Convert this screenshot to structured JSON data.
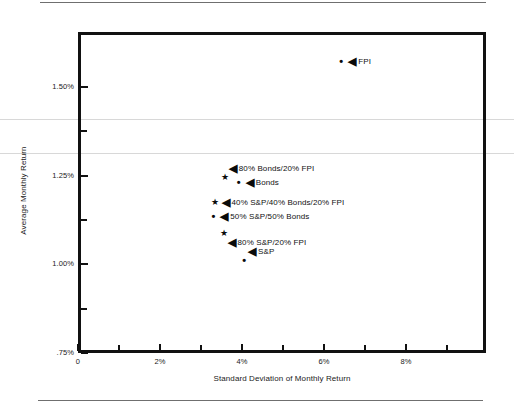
{
  "chart_data": {
    "type": "scatter",
    "title": "",
    "xlabel": "Standard Deviation of Monthly Return",
    "ylabel": "Average Monthly Return",
    "xlim": [
      0,
      9.95
    ],
    "ylim": [
      0.75,
      1.655
    ],
    "grid": false,
    "legend": "none",
    "x_ticks_major": [
      "0",
      "2%",
      "4%",
      "6%",
      "8%"
    ],
    "x_tick_values_major": [
      0,
      2,
      4,
      6,
      8
    ],
    "x_tick_values_minor": [
      1,
      3,
      5,
      7,
      9
    ],
    "y_ticks_major": [
      ".75%",
      "1.00%",
      "1.25%",
      "1.50%"
    ],
    "y_tick_values_major": [
      0.75,
      1.0,
      1.25,
      1.5
    ],
    "y_tick_values_minor": [
      0.875,
      1.125,
      1.375
    ],
    "points": [
      {
        "label": "FPI",
        "x": 6.42,
        "y": 1.573,
        "marker": "dot",
        "label_side": "right"
      },
      {
        "label": "80% Bonds/20% FPI",
        "x": 3.58,
        "y": 1.245,
        "marker": "star",
        "label_side": "above-right"
      },
      {
        "label": "Bonds",
        "x": 3.92,
        "y": 1.232,
        "marker": "dot",
        "label_side": "right"
      },
      {
        "label": "40% S&P/40% Bonds/20% FPI",
        "x": 3.33,
        "y": 1.177,
        "marker": "star",
        "label_side": "right"
      },
      {
        "label": "50% S&P/50% Bonds",
        "x": 3.3,
        "y": 1.137,
        "marker": "dot",
        "label_side": "right"
      },
      {
        "label": "80% S&P/20% FPI",
        "x": 3.55,
        "y": 1.089,
        "marker": "star",
        "label_side": "below-right"
      },
      {
        "label": "S&P",
        "x": 4.05,
        "y": 1.012,
        "marker": "dot",
        "label_side": "above-right"
      }
    ],
    "marker_glyphs": {
      "star": "★",
      "dot": "•",
      "callout_arrow": "◀"
    }
  },
  "colors": {
    "ink": "#111111",
    "frame": "#111111",
    "page_rule": "#6f6f6f",
    "scan_line": "#d8d8d8",
    "background": "#ffffff"
  }
}
